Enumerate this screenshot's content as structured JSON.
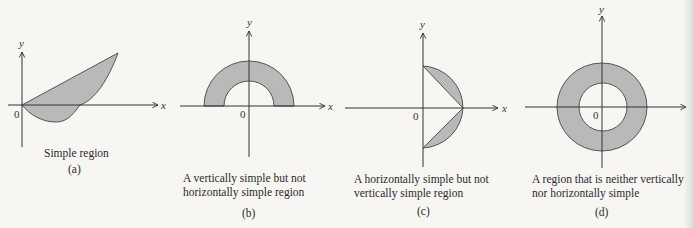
{
  "figure": {
    "fill_color": "#b9b9b9",
    "stroke_color": "#555555",
    "axis_color": "#333333",
    "background": "#f7f6f3"
  },
  "panels": [
    {
      "id": "a",
      "label": "(a)",
      "caption_lines": [
        "Simple region"
      ],
      "x_axis_label": "x",
      "y_axis_label": "y",
      "origin_label": "0",
      "shape": "region bounded above by a line from the origin and below by a curve dipping below the x-axis"
    },
    {
      "id": "b",
      "label": "(b)",
      "caption_lines": [
        "A vertically simple but not",
        "horizontally simple region"
      ],
      "x_axis_label": "x",
      "y_axis_label": "y",
      "origin_label": "0",
      "shape": "upper half annulus"
    },
    {
      "id": "c",
      "label": "(c)",
      "caption_lines": [
        "A horizontally simple but not",
        "vertically simple region"
      ],
      "x_axis_label": "x",
      "y_axis_label": "y",
      "origin_label": "0",
      "shape": "right half disk minus triangle (two crescent wedges)"
    },
    {
      "id": "d",
      "label": "(d)",
      "caption_lines": [
        "A region that is neither vertically",
        "nor horizontally simple"
      ],
      "x_axis_label": "x",
      "y_axis_label": "y",
      "origin_label": "0",
      "shape": "full annulus"
    }
  ]
}
